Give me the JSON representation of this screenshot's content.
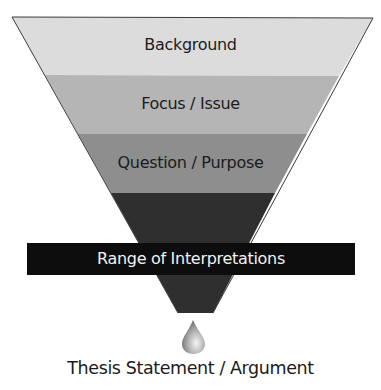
{
  "diagram": {
    "type": "funnel",
    "layers": [
      {
        "label": "Background",
        "color": "#dcdcdc"
      },
      {
        "label": "Focus / Issue",
        "color": "#b5b5b5"
      },
      {
        "label": "Question / Purpose",
        "color": "#8e8e8e"
      },
      {
        "label": "",
        "color": "#2f2f2f"
      }
    ],
    "band": {
      "label": "Range of Interpretations",
      "color": "#0d0d0d"
    },
    "drop": {
      "icon": "drop-icon"
    },
    "output": {
      "label": "Thesis Statement / Argument"
    }
  }
}
